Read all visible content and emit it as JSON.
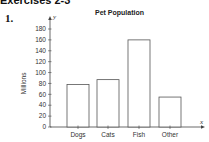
{
  "header": {
    "section": "Exercises 2-3",
    "problem_number": "1."
  },
  "chart_data": {
    "type": "bar",
    "title": "Pet Population",
    "xlabel": "x",
    "ylabel": "Millions",
    "y_axis_var": "y",
    "categories": [
      "Dogs",
      "Cats",
      "Fish",
      "Other"
    ],
    "values": [
      78,
      87,
      160,
      55
    ],
    "ylim": [
      0,
      180
    ],
    "yticks": [
      0,
      20,
      40,
      60,
      80,
      100,
      120,
      140,
      160,
      180
    ],
    "grid": false,
    "legend": null
  }
}
